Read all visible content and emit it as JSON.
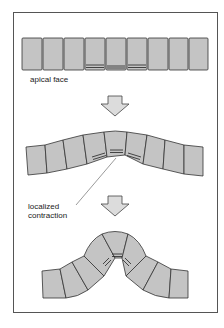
{
  "figure": {
    "labels": {
      "apical_face": "apical face",
      "localized_line1": "localized",
      "localized_line2": "contraction"
    },
    "stages": [
      {
        "name": "flat epithelium",
        "cells": 9,
        "contracted_cells": [
          4,
          5,
          6
        ]
      },
      {
        "name": "beginning fold",
        "cells": 9,
        "contracted_cells": [
          4,
          5,
          6
        ]
      },
      {
        "name": "invaginated fold",
        "cells": 9,
        "contracted_cells": [
          4,
          5,
          6
        ]
      }
    ],
    "arrows": [
      {
        "direction": "down",
        "semantic": "arrow-down-icon"
      },
      {
        "direction": "down",
        "semantic": "arrow-down-icon"
      }
    ],
    "colors": {
      "cell_fill": "#c4c4c4",
      "cell_stroke": "#333333",
      "frame_stroke": "#555555",
      "arrow_fill": "#dcdcdc"
    }
  }
}
